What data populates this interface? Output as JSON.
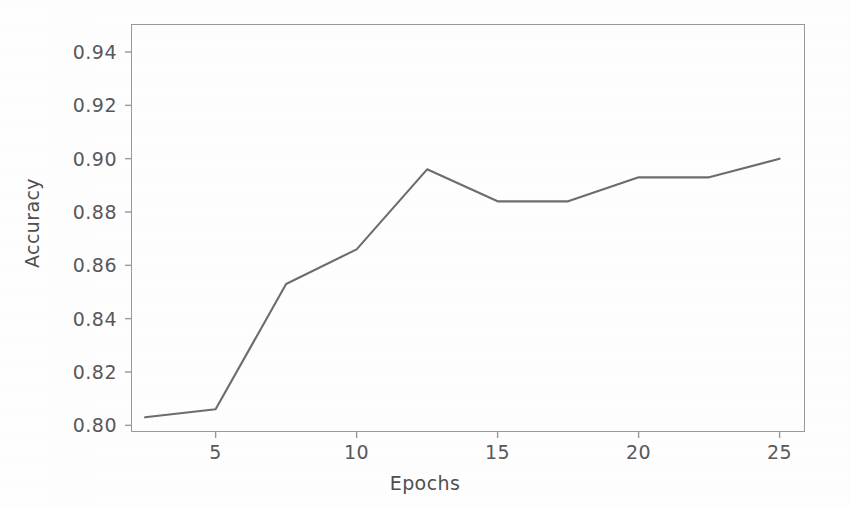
{
  "chart_data": {
    "type": "line",
    "title": "",
    "xlabel": "Epochs",
    "ylabel": "Accuracy",
    "x": [
      2.5,
      5,
      7.5,
      10,
      12.5,
      15,
      17.5,
      20,
      22.5,
      25
    ],
    "values": [
      0.803,
      0.806,
      0.853,
      0.866,
      0.896,
      0.884,
      0.884,
      0.893,
      0.893,
      0.9
    ],
    "series": [
      {
        "name": "Accuracy",
        "values": [
          0.803,
          0.806,
          0.853,
          0.866,
          0.896,
          0.884,
          0.884,
          0.893,
          0.893,
          0.9
        ],
        "color": "#6d6d6f"
      }
    ],
    "xlim": [
      2.0,
      25.9
    ],
    "ylim": [
      0.7975,
      0.9505
    ],
    "xticks": [
      5,
      10,
      15,
      20,
      25
    ],
    "xtick_labels": [
      "5",
      "10",
      "15",
      "20",
      "25"
    ],
    "yticks": [
      0.8,
      0.82,
      0.84,
      0.86,
      0.88,
      0.9,
      0.92,
      0.94
    ],
    "ytick_labels": [
      "0.80",
      "0.82",
      "0.84",
      "0.86",
      "0.88",
      "0.90",
      "0.92",
      "0.94"
    ],
    "grid": false,
    "legend": null,
    "legend_position": "none",
    "annotations": [],
    "marker": "none",
    "line_width": 2.1
  },
  "style": {
    "background": "#ffffff",
    "axis_color": "#9a9a9a",
    "tick_color": "#9a9a9a",
    "label_color": "#59595b",
    "axis_title_color": "#4f4f51",
    "line_color": "#6d6d6f"
  },
  "figure": {
    "width": 850,
    "height": 508,
    "plot_left": 131,
    "plot_top": 24,
    "plot_width": 674,
    "plot_height": 408
  }
}
